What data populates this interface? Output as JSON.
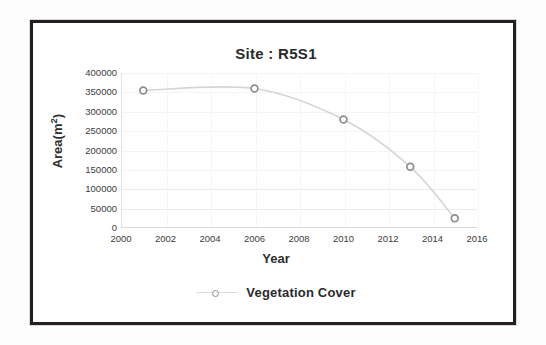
{
  "chart_data": {
    "type": "line",
    "title": "Site : R5S1",
    "xlabel": "Year",
    "ylabel": "Area(m²)",
    "ylabel_base": "Area(m",
    "ylabel_sup": "2",
    "ylabel_close": ")",
    "xlim": [
      2000,
      2016
    ],
    "ylim": [
      0,
      400000
    ],
    "grid": true,
    "legend_position": "bottom",
    "xticks": [
      2000,
      2002,
      2004,
      2006,
      2008,
      2010,
      2012,
      2014,
      2016
    ],
    "xtick_labels": [
      "2000",
      "2002",
      "2004",
      "2006",
      "2008",
      "2010",
      "2012",
      "2014",
      "2016"
    ],
    "yticks": [
      0,
      50000,
      100000,
      150000,
      200000,
      250000,
      300000,
      350000,
      400000
    ],
    "ytick_labels": [
      "0",
      "50000",
      "100000",
      "150000",
      "200000",
      "250000",
      "300000",
      "350000",
      "400000"
    ],
    "series": [
      {
        "name": "Vegetation Cover",
        "marker": "circle-open",
        "line_color": "#d5d5d5",
        "marker_color": "#8d8d8d",
        "x": [
          2001,
          2006,
          2010,
          2013,
          2015
        ],
        "values": [
          355000,
          360000,
          280000,
          158000,
          25000
        ],
        "points": [
          {
            "x": 2001,
            "y": 355000
          },
          {
            "x": 2006,
            "y": 360000
          },
          {
            "x": 2010,
            "y": 280000
          },
          {
            "x": 2013,
            "y": 158000
          },
          {
            "x": 2015,
            "y": 25000
          }
        ]
      }
    ]
  },
  "legend": {
    "entries": [
      {
        "label": "Vegetation Cover"
      }
    ]
  },
  "colors": {
    "frame": "#231f20",
    "line": "#d5d5d5",
    "marker_stroke": "#8d8d8d",
    "grid": "#f4f4f4",
    "text": "#2a2a2a"
  }
}
